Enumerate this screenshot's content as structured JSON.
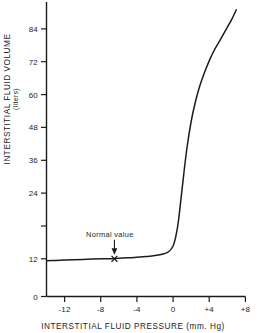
{
  "chart_data": {
    "type": "line",
    "title": "",
    "xlabel": "INTERSTITIAL  FLUID  PRESSURE   (mm. Hg)",
    "ylabel": "INTERSTITIAL  FLUID  VOLUME",
    "ylabel_units": "(liters)",
    "xlim": [
      -14,
      8
    ],
    "ylim": [
      0,
      92
    ],
    "grid": false,
    "legend": null,
    "xticks": [
      -12,
      -8,
      -4,
      0,
      4,
      8
    ],
    "xtick_labels": [
      "-12",
      "-8",
      "-4",
      "0",
      "+4",
      "+8"
    ],
    "yticks": [
      0,
      12,
      24,
      36,
      48,
      60,
      72,
      84
    ],
    "ytick_labels": [
      "0",
      "12",
      "24",
      "36",
      "48",
      "60",
      "72",
      "84"
    ],
    "series": [
      {
        "name": "Interstitial fluid volume vs pressure",
        "x": [
          -14,
          -13,
          -12,
          -11,
          -10,
          -9,
          -8,
          -7,
          -6.5,
          -6,
          -5,
          -4,
          -3,
          -2,
          -1,
          -0.5,
          0,
          0.3,
          0.6,
          1,
          1.5,
          2,
          2.5,
          3,
          3.5,
          4,
          4.5,
          5,
          5.5,
          6,
          6.5,
          7
        ],
        "y": [
          11.4,
          11.5,
          11.6,
          11.7,
          11.8,
          11.9,
          12.0,
          12.0,
          12.1,
          12.2,
          12.3,
          12.5,
          12.7,
          13.0,
          13.6,
          14.2,
          16.0,
          19.0,
          24.0,
          34.0,
          46.0,
          55.0,
          61.5,
          66.5,
          70.5,
          74.0,
          77.0,
          79.5,
          82.0,
          84.5,
          87.0,
          90.0
        ]
      }
    ],
    "annotations": [
      {
        "name": "normal-value",
        "text": "Normal  value",
        "marker": "x",
        "x": -6.5,
        "y": 12.0,
        "arrow": true,
        "arrow_from_y": 18.0
      }
    ]
  },
  "axis": {
    "x_title": "INTERSTITIAL  FLUID  PRESSURE   (mm. Hg)",
    "y_title": "INTERSTITIAL  FLUID  VOLUME",
    "y_subtitle": "(liters)"
  },
  "annotation": {
    "normal_value_text": "Normal  value"
  },
  "colors": {
    "background": "#ffffff",
    "ink": "#1c1c1c",
    "curve": "#1c1c1c"
  }
}
